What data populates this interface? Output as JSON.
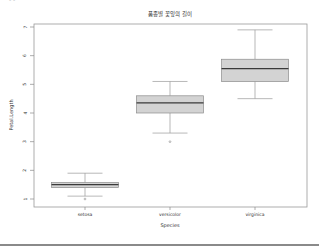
{
  "page": {
    "corner_fragment": "- -"
  },
  "chart_data": {
    "type": "boxplot",
    "title": "품종별 꽃잎의 길이",
    "xlabel": "Species",
    "ylabel": "Petal.Length",
    "categories": [
      "setosa",
      "versicolor",
      "virginica"
    ],
    "ylim": [
      0.9,
      7.1
    ],
    "yticks": [
      1,
      2,
      3,
      4,
      5,
      6,
      7
    ],
    "grid": false,
    "legend": null,
    "series": [
      {
        "name": "setosa",
        "whisker_low": 1.1,
        "q1": 1.4,
        "median": 1.5,
        "q3": 1.575,
        "whisker_high": 1.9,
        "outliers": [
          1.0
        ]
      },
      {
        "name": "versicolor",
        "whisker_low": 3.3,
        "q1": 4.0,
        "median": 4.35,
        "q3": 4.6,
        "whisker_high": 5.1,
        "outliers": [
          3.0
        ]
      },
      {
        "name": "virginica",
        "whisker_low": 4.5,
        "q1": 5.1,
        "median": 5.55,
        "q3": 5.875,
        "whisker_high": 6.9,
        "outliers": []
      }
    ],
    "colors": {
      "box_fill": "#d3d3d3",
      "box_stroke": "#8c8c8c",
      "median": "#3a3a3a",
      "whisker": "#9a9a9a",
      "axis": "#8a8a8a",
      "text": "#333333"
    }
  }
}
